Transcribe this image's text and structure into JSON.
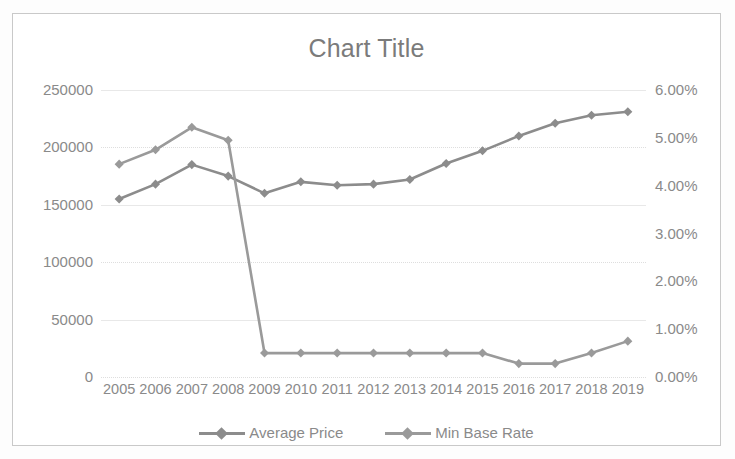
{
  "chart_data": {
    "type": "line",
    "title": "Chart Title",
    "xlabel": "",
    "ylabel": "",
    "grid": true,
    "legend_position": "bottom",
    "categories": [
      "2005",
      "2006",
      "2007",
      "2008",
      "2009",
      "2010",
      "2011",
      "2012",
      "2013",
      "2014",
      "2015",
      "2016",
      "2017",
      "2018",
      "2019"
    ],
    "x_tick_labels": [
      "2005",
      "2006",
      "2007",
      "2008",
      "2009",
      "2010",
      "2011",
      "2012",
      "2013",
      "2014",
      "2015",
      "2016",
      "2017",
      "2018",
      "2019"
    ],
    "y_left": {
      "ticks": [
        0,
        50000,
        100000,
        150000,
        200000,
        250000
      ],
      "tick_labels": [
        "0",
        "50000",
        "100000",
        "150000",
        "200000",
        "250000"
      ],
      "ylim": [
        0,
        250000
      ]
    },
    "y_right": {
      "ticks": [
        0,
        1,
        2,
        3,
        4,
        5,
        6
      ],
      "tick_labels": [
        "0.00%",
        "1.00%",
        "2.00%",
        "3.00%",
        "4.00%",
        "5.00%",
        "6.00%"
      ],
      "ylim": [
        0,
        6
      ]
    },
    "series": [
      {
        "name": "Average Price",
        "axis": "left",
        "color": "#8c8c8c",
        "marker": "diamond",
        "values": [
          155000,
          168000,
          185000,
          175000,
          160000,
          170000,
          167000,
          168000,
          172000,
          186000,
          197000,
          210000,
          221000,
          228000,
          231000
        ]
      },
      {
        "name": "Min Base Rate",
        "axis": "right",
        "color": "#9a9a9a",
        "marker": "diamond",
        "values": [
          4.45,
          4.75,
          5.22,
          4.95,
          0.5,
          0.5,
          0.5,
          0.5,
          0.5,
          0.5,
          0.5,
          0.28,
          0.28,
          0.5,
          0.75
        ]
      }
    ]
  },
  "legend": {
    "entries": [
      {
        "label": "Average Price",
        "color": "#8c8c8c"
      },
      {
        "label": "Min Base Rate",
        "color": "#9a9a9a"
      }
    ]
  },
  "colors": {
    "frame_border": "#c9c9c9",
    "gridline": "#e8e8e8",
    "text": "#8a8a8a",
    "title_text": "#7b7b7b",
    "background": "#ffffff",
    "series_1": "#8c8c8c",
    "series_2": "#9a9a9a"
  }
}
